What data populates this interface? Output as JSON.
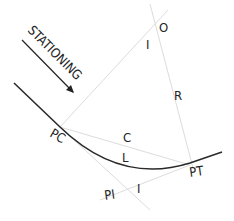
{
  "diagram": {
    "labels": {
      "stationing": "STATIONING",
      "pc": "PC",
      "pt": "PT",
      "pi": "PI",
      "o": "O",
      "r": "R",
      "c": "C",
      "l": "L",
      "i_top": "I",
      "i_bottom": "I"
    },
    "colors": {
      "curve": "#2a2a2a",
      "construction": "#dcdcdc",
      "text": "#222222"
    }
  }
}
